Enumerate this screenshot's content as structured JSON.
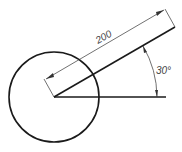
{
  "drawing": {
    "linear_dimension": "200",
    "angle_dimension": "30°",
    "colors": {
      "line": "#1a1a1a",
      "dimension": "#333333",
      "text": "#444444",
      "background": "#ffffff"
    }
  }
}
